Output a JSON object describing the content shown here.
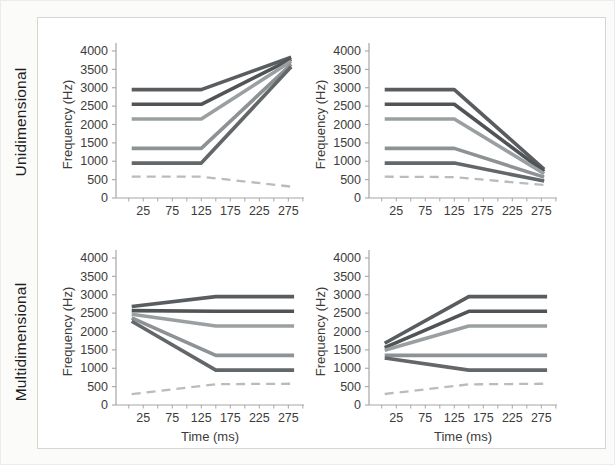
{
  "rows": [
    {
      "label": "Unidimensional"
    },
    {
      "label": "Multidimensional"
    }
  ],
  "colors": {
    "axis": "#a6a6a2",
    "panel_border": "#d6d6d2",
    "background": "#fbfbf9",
    "text": "#3c3c3a"
  },
  "chart_data": [
    {
      "type": "line",
      "panel": "top-left",
      "row_label": "Unidimensional",
      "xlabel": "",
      "ylabel": "Frequency (Hz)",
      "xlim": [
        -22,
        302
      ],
      "ylim": [
        0,
        4000
      ],
      "xticks": [
        25,
        75,
        125,
        175,
        225,
        275
      ],
      "xticks_minor_range": [
        0,
        300
      ],
      "xticks_minor_step": 25,
      "yticks": [
        0,
        500,
        1000,
        1500,
        2000,
        2500,
        3000,
        3500,
        4000
      ],
      "series": [
        {
          "name": "2950 Hz rising glide",
          "x": [
            5,
            125,
            280
          ],
          "y": [
            2950,
            2950,
            3830
          ],
          "color": "#5a5d60",
          "dashed": false
        },
        {
          "name": "2550 Hz rising glide",
          "x": [
            5,
            125,
            280
          ],
          "y": [
            2550,
            2550,
            3780
          ],
          "color": "#515456",
          "dashed": false
        },
        {
          "name": "2150 Hz rising glide",
          "x": [
            5,
            125,
            280
          ],
          "y": [
            2150,
            2150,
            3720
          ],
          "color": "#9aa0a1",
          "dashed": false
        },
        {
          "name": "1350 Hz rising glide",
          "x": [
            5,
            125,
            280
          ],
          "y": [
            1350,
            1350,
            3640
          ],
          "color": "#8d9294",
          "dashed": false
        },
        {
          "name": "950 Hz rising glide",
          "x": [
            5,
            125,
            280
          ],
          "y": [
            950,
            950,
            3570
          ],
          "color": "#63676a",
          "dashed": false
        },
        {
          "name": "580 Hz dashed falling",
          "x": [
            5,
            125,
            280
          ],
          "y": [
            580,
            580,
            310
          ],
          "color": "#b9bcbe",
          "dashed": true
        }
      ]
    },
    {
      "type": "line",
      "panel": "top-right",
      "row_label": "Unidimensional",
      "xlabel": "",
      "ylabel": "Frequency (Hz)",
      "xlim": [
        -22,
        302
      ],
      "ylim": [
        0,
        4000
      ],
      "xticks": [
        25,
        75,
        125,
        175,
        225,
        275
      ],
      "xticks_minor_range": [
        0,
        300
      ],
      "xticks_minor_step": 25,
      "yticks": [
        0,
        500,
        1000,
        1500,
        2000,
        2500,
        3000,
        3500,
        4000
      ],
      "series": [
        {
          "name": "2950 Hz falling glide",
          "x": [
            5,
            125,
            280
          ],
          "y": [
            2950,
            2950,
            780
          ],
          "color": "#5a5d60",
          "dashed": false
        },
        {
          "name": "2550 Hz falling glide",
          "x": [
            5,
            125,
            280
          ],
          "y": [
            2550,
            2550,
            720
          ],
          "color": "#515456",
          "dashed": false
        },
        {
          "name": "2150 Hz falling glide",
          "x": [
            5,
            125,
            280
          ],
          "y": [
            2150,
            2150,
            660
          ],
          "color": "#9aa0a1",
          "dashed": false
        },
        {
          "name": "1350 Hz falling glide",
          "x": [
            5,
            125,
            280
          ],
          "y": [
            1350,
            1350,
            570
          ],
          "color": "#8d9294",
          "dashed": false
        },
        {
          "name": "950 Hz falling glide",
          "x": [
            5,
            125,
            280
          ],
          "y": [
            950,
            950,
            460
          ],
          "color": "#63676a",
          "dashed": false
        },
        {
          "name": "580 Hz dashed falling",
          "x": [
            5,
            125,
            280
          ],
          "y": [
            580,
            570,
            355
          ],
          "color": "#b9bcbe",
          "dashed": true
        }
      ]
    },
    {
      "type": "line",
      "panel": "bottom-left",
      "row_label": "Multidimensional",
      "xlabel": "Time (ms)",
      "ylabel": "Frequency (Hz)",
      "xlim": [
        -22,
        302
      ],
      "ylim": [
        0,
        4000
      ],
      "xticks": [
        25,
        75,
        125,
        175,
        225,
        275
      ],
      "xticks_minor_range": [
        0,
        300
      ],
      "xticks_minor_step": 25,
      "yticks": [
        0,
        500,
        1000,
        1500,
        2000,
        2500,
        3000,
        3500,
        4000
      ],
      "series": [
        {
          "name": "glide to 2950 Hz",
          "x": [
            5,
            150,
            285
          ],
          "y": [
            2680,
            2950,
            2950
          ],
          "color": "#5a5d60",
          "dashed": false
        },
        {
          "name": "glide to 2550 Hz",
          "x": [
            5,
            150,
            285
          ],
          "y": [
            2570,
            2550,
            2550
          ],
          "color": "#515456",
          "dashed": false
        },
        {
          "name": "glide to 2150 Hz",
          "x": [
            5,
            150,
            285
          ],
          "y": [
            2470,
            2150,
            2150
          ],
          "color": "#9aa0a1",
          "dashed": false
        },
        {
          "name": "glide to 1350 Hz",
          "x": [
            5,
            150,
            285
          ],
          "y": [
            2370,
            1350,
            1350
          ],
          "color": "#8d9294",
          "dashed": false
        },
        {
          "name": "glide to 950 Hz",
          "x": [
            5,
            150,
            285
          ],
          "y": [
            2280,
            950,
            950
          ],
          "color": "#63676a",
          "dashed": false
        },
        {
          "name": "dashed rise to 580 Hz",
          "x": [
            5,
            150,
            285
          ],
          "y": [
            295,
            565,
            580
          ],
          "color": "#b9bcbe",
          "dashed": true
        }
      ]
    },
    {
      "type": "line",
      "panel": "bottom-right",
      "row_label": "Multidimensional",
      "xlabel": "Time (ms)",
      "ylabel": "Frequency (Hz)",
      "xlim": [
        -22,
        302
      ],
      "ylim": [
        0,
        4000
      ],
      "xticks": [
        25,
        75,
        125,
        175,
        225,
        275
      ],
      "xticks_minor_range": [
        0,
        300
      ],
      "xticks_minor_step": 25,
      "yticks": [
        0,
        500,
        1000,
        1500,
        2000,
        2500,
        3000,
        3500,
        4000
      ],
      "series": [
        {
          "name": "glide to 2950 Hz",
          "x": [
            5,
            150,
            285
          ],
          "y": [
            1680,
            2950,
            2950
          ],
          "color": "#5a5d60",
          "dashed": false
        },
        {
          "name": "glide to 2550 Hz",
          "x": [
            5,
            150,
            285
          ],
          "y": [
            1560,
            2550,
            2550
          ],
          "color": "#515456",
          "dashed": false
        },
        {
          "name": "glide to 2150 Hz",
          "x": [
            5,
            150,
            285
          ],
          "y": [
            1490,
            2150,
            2150
          ],
          "color": "#9aa0a1",
          "dashed": false
        },
        {
          "name": "flat 1350 Hz",
          "x": [
            5,
            150,
            285
          ],
          "y": [
            1350,
            1350,
            1350
          ],
          "color": "#8d9294",
          "dashed": false
        },
        {
          "name": "glide to 950 Hz",
          "x": [
            5,
            150,
            285
          ],
          "y": [
            1280,
            950,
            950
          ],
          "color": "#63676a",
          "dashed": false
        },
        {
          "name": "dashed rise to 580 Hz",
          "x": [
            5,
            150,
            285
          ],
          "y": [
            300,
            560,
            580
          ],
          "color": "#b9bcbe",
          "dashed": true
        }
      ]
    }
  ]
}
